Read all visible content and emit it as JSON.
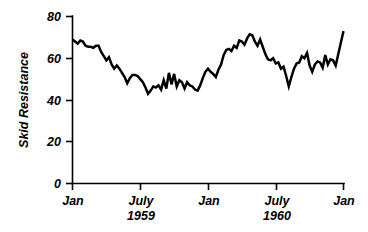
{
  "chart_data": {
    "type": "line",
    "title": "",
    "xlabel": "",
    "ylabel": "Skid Resistance",
    "ylim": [
      0,
      80
    ],
    "yticks": [
      0,
      20,
      40,
      60,
      80
    ],
    "ytick_labels": [
      "0",
      "20",
      "40",
      "60",
      "80"
    ],
    "xlim": [
      0,
      104
    ],
    "xticks": [
      0,
      26,
      52,
      78,
      104
    ],
    "xtick_labels": [
      "Jan",
      "July",
      "Jan",
      "July",
      "Jan"
    ],
    "xtick_sublabels": [
      "",
      "1959",
      "",
      "1960",
      ""
    ],
    "grid": false,
    "legend": "none",
    "series": [
      {
        "name": "Skid Resistance",
        "x": [
          0,
          1,
          2,
          3,
          4,
          5,
          6,
          7,
          8,
          9,
          10,
          11,
          12,
          13,
          14,
          15,
          16,
          17,
          18,
          19,
          20,
          21,
          22,
          23,
          24,
          25,
          26,
          27,
          28,
          29,
          30,
          31,
          32,
          33,
          34,
          35,
          36,
          37,
          38,
          39,
          40,
          41,
          42,
          43,
          44,
          45,
          46,
          47,
          48,
          49,
          50,
          51,
          52,
          53,
          54,
          55,
          56,
          57,
          58,
          59,
          60,
          61,
          62,
          63,
          64,
          65,
          66,
          67,
          68,
          69,
          70,
          71,
          72,
          73,
          74,
          75,
          76,
          77,
          78,
          79,
          80,
          81,
          82,
          83,
          84,
          85,
          86,
          87,
          88,
          89,
          90,
          91,
          92,
          93,
          94,
          95,
          96,
          97,
          98,
          99,
          100,
          101,
          102,
          103,
          104
        ],
        "values": [
          69.0,
          68.0,
          67.0,
          68.5,
          68.0,
          66.0,
          65.5,
          65.5,
          65.0,
          66.0,
          66.0,
          63.0,
          61.0,
          59.0,
          60.5,
          57.0,
          55.0,
          56.5,
          55.0,
          53.0,
          51.0,
          48.0,
          50.5,
          52.0,
          52.0,
          51.5,
          50.0,
          48.5,
          46.0,
          43.0,
          44.5,
          46.5,
          46.0,
          47.0,
          45.0,
          49.5,
          45.5,
          53.0,
          47.5,
          52.5,
          46.5,
          49.5,
          48.5,
          45.5,
          48.5,
          47.0,
          46.5,
          45.0,
          44.5,
          47.0,
          50.5,
          53.5,
          55.0,
          53.5,
          52.5,
          51.0,
          54.5,
          57.0,
          61.5,
          64.0,
          64.5,
          63.5,
          66.0,
          65.0,
          68.5,
          68.0,
          66.5,
          69.5,
          71.5,
          71.0,
          68.0,
          66.0,
          69.0,
          65.5,
          62.0,
          59.5,
          59.0,
          60.0,
          57.5,
          58.0,
          55.0,
          56.0,
          51.5,
          46.5,
          51.0,
          55.0,
          57.5,
          58.0,
          61.0,
          60.0,
          62.5,
          56.5,
          53.5,
          57.0,
          58.5,
          58.0,
          55.5,
          61.5,
          57.0,
          59.5,
          59.0,
          56.5,
          62.0,
          67.5,
          73.0
        ]
      }
    ]
  },
  "axes": {
    "y_title": "Skid Resistance",
    "y_tick_80": "80",
    "y_tick_60": "60",
    "y_tick_40": "40",
    "y_tick_20": "20",
    "y_tick_0": "0",
    "x_tick_1_label": "Jan",
    "x_tick_2_label": "July",
    "x_tick_2_year": "1959",
    "x_tick_3_label": "Jan",
    "x_tick_4_label": "July",
    "x_tick_4_year": "1960",
    "x_tick_5_label": "Jan"
  },
  "style": {
    "background": "#ffffff",
    "ink": "#000000",
    "series_color": "#000000"
  }
}
